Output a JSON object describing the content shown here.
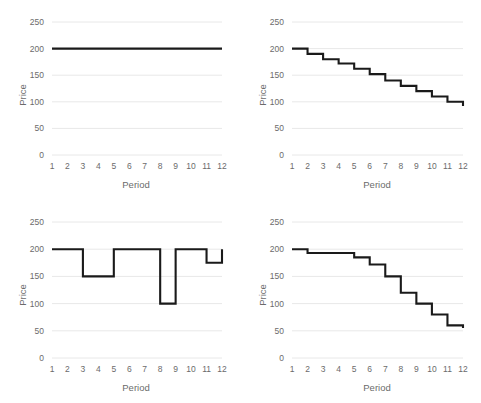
{
  "figure": {
    "panel_count": 4,
    "axis": {
      "xlabel": "Period",
      "ylabel": "Price",
      "yticks": [
        "0",
        "50",
        "100",
        "150",
        "200",
        "250"
      ],
      "xticks": [
        "1",
        "2",
        "3",
        "4",
        "5",
        "6",
        "7",
        "8",
        "9",
        "10",
        "11",
        "12"
      ]
    },
    "colors": {
      "line": "#1a1a1a",
      "gridline": "#e8e8e8",
      "text": "#6b6b6b",
      "background": "#ffffff"
    }
  },
  "chart_data": [
    {
      "type": "line",
      "panel": "top-left",
      "title": "",
      "xlabel": "Period",
      "ylabel": "Price",
      "xlim": [
        1,
        12
      ],
      "ylim": [
        0,
        250
      ],
      "grid": true,
      "legend": "none",
      "step": "post",
      "x": [
        1,
        2,
        3,
        4,
        5,
        6,
        7,
        8,
        9,
        10,
        11,
        12
      ],
      "values": [
        200,
        200,
        200,
        200,
        200,
        200,
        200,
        200,
        200,
        200,
        200,
        200
      ],
      "annotation": "constant price at 200 across all periods"
    },
    {
      "type": "line",
      "panel": "top-right",
      "title": "",
      "xlabel": "Period",
      "ylabel": "Price",
      "xlim": [
        1,
        12
      ],
      "ylim": [
        0,
        250
      ],
      "grid": true,
      "legend": "none",
      "step": "post",
      "x": [
        1,
        2,
        3,
        4,
        5,
        6,
        7,
        8,
        9,
        10,
        11,
        12
      ],
      "values": [
        200,
        190,
        180,
        172,
        162,
        152,
        140,
        130,
        120,
        110,
        100,
        92
      ],
      "annotation": "steady linear decline, roughly 10 per period"
    },
    {
      "type": "line",
      "panel": "bottom-left",
      "title": "",
      "xlabel": "Period",
      "ylabel": "Price",
      "xlim": [
        1,
        12
      ],
      "ylim": [
        0,
        250
      ],
      "grid": true,
      "legend": "none",
      "step": "post",
      "x": [
        1,
        2,
        3,
        4,
        5,
        6,
        7,
        8,
        9,
        10,
        11,
        12
      ],
      "values": [
        200,
        200,
        150,
        150,
        200,
        200,
        200,
        100,
        200,
        200,
        175,
        200
      ],
      "annotation": "volatile price with sharp dips at periods 3-4, 8 and 11"
    },
    {
      "type": "line",
      "panel": "bottom-right",
      "title": "",
      "xlabel": "Period",
      "ylabel": "Price",
      "xlim": [
        1,
        12
      ],
      "ylim": [
        0,
        250
      ],
      "grid": true,
      "legend": "none",
      "step": "post",
      "x": [
        1,
        2,
        3,
        4,
        5,
        6,
        7,
        8,
        9,
        10,
        11,
        12
      ],
      "values": [
        200,
        193,
        193,
        193,
        185,
        172,
        150,
        120,
        100,
        80,
        60,
        55
      ],
      "annotation": "accelerating decline, small steps early then steep drops"
    }
  ]
}
